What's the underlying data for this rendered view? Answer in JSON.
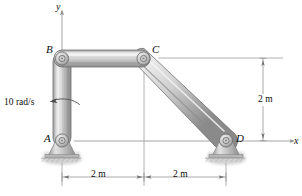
{
  "figure": {
    "points": [
      {
        "id": "A",
        "label": "A",
        "x": 62,
        "y": 141,
        "role": "ground-pin-support"
      },
      {
        "id": "B",
        "label": "B",
        "x": 62,
        "y": 58,
        "role": "pin-joint"
      },
      {
        "id": "C",
        "label": "C",
        "x": 144,
        "y": 58,
        "role": "pin-joint"
      },
      {
        "id": "D",
        "label": "D",
        "x": 226,
        "y": 141,
        "role": "ground-pin-support"
      }
    ],
    "links": [
      {
        "id": "AB",
        "from": "A",
        "to": "B",
        "orientation": "vertical"
      },
      {
        "id": "BC",
        "from": "B",
        "to": "C",
        "orientation": "horizontal"
      },
      {
        "id": "CD",
        "from": "C",
        "to": "D",
        "orientation": "diagonal"
      }
    ],
    "axes": {
      "y_label": "y",
      "x_label": "x",
      "origin": "A"
    },
    "annotations": {
      "angular_velocity": "10 rad/s",
      "angular_velocity_sense": "counterclockwise"
    },
    "dimensions": [
      {
        "id": "bottom-left",
        "label": "2 m",
        "value": 2,
        "unit": "m",
        "direction": "horizontal",
        "from": "A",
        "to": "C-projection"
      },
      {
        "id": "bottom-right",
        "label": "2 m",
        "value": 2,
        "unit": "m",
        "direction": "horizontal",
        "from": "C-projection",
        "to": "D"
      },
      {
        "id": "right-vertical",
        "label": "2 m",
        "value": 2,
        "unit": "m",
        "direction": "vertical",
        "from": "C-level",
        "to": "D-level"
      }
    ],
    "figure_number": "",
    "colors": {
      "link_light": "#e8e8e8",
      "link_mid": "#b8b8b8",
      "link_dark": "#8a8a8a",
      "outline": "#6b6b6b",
      "ink": "#0d0d0d",
      "thin_line": "#9a9a9a",
      "ground": "#c9c9c9"
    }
  }
}
